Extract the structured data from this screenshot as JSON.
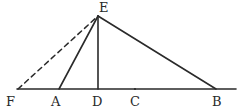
{
  "diagram": {
    "type": "geometry",
    "points": {
      "E": {
        "label": "E",
        "x": 98,
        "y": 16
      },
      "F": {
        "label": "F",
        "x": 18,
        "y": 89
      },
      "A": {
        "label": "A",
        "x": 59,
        "y": 89
      },
      "D": {
        "label": "D",
        "x": 98,
        "y": 89
      },
      "C": {
        "label": "C",
        "x": 135,
        "y": 89
      },
      "B": {
        "label": "B",
        "x": 216,
        "y": 89
      }
    },
    "segments": [
      {
        "from": "F",
        "to": "E",
        "style": "dashed"
      },
      {
        "from": "A",
        "to": "E",
        "style": "solid"
      },
      {
        "from": "D",
        "to": "E",
        "style": "solid"
      },
      {
        "from": "E",
        "to": "B",
        "style": "solid"
      },
      {
        "from": "F",
        "to": "B",
        "style": "solid",
        "note": "baseline extends past B"
      }
    ],
    "labels": {
      "E": "E",
      "F": "F",
      "A": "A",
      "D": "D",
      "C": "C",
      "B": "B"
    }
  }
}
